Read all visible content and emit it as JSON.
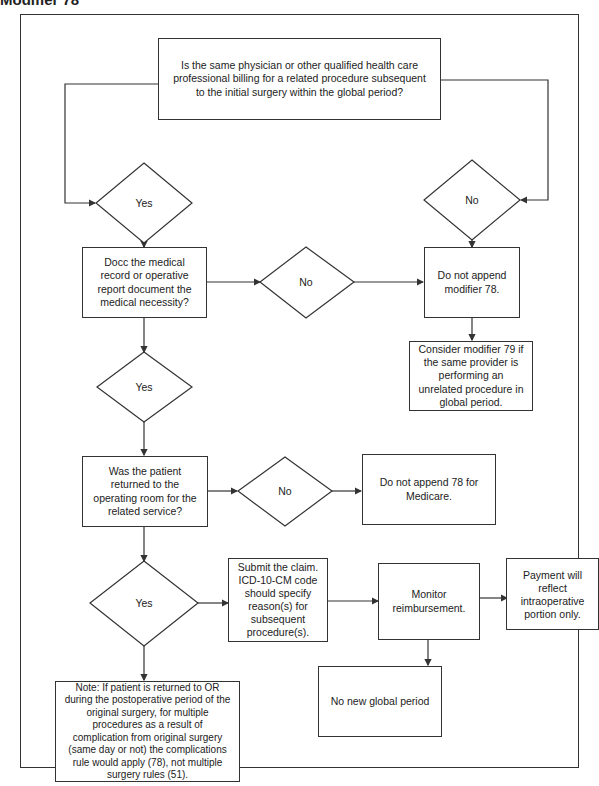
{
  "heading": "Modifier 78",
  "nodes": {
    "q_same_physician": "Is the same physician or other qualified health care professional billing for a related procedure subsequent to the initial surgery within the global period?",
    "d1_yes": "Yes",
    "d1_no": "No",
    "q_medical_necessity": "Docc the medical record or operative report document the medical necessity?",
    "d2_no": "No",
    "r_no_modifier_78": "Do not append modifier 78.",
    "r_consider_79": "Consider modifier 79 if the same provider is performing an unrelated procedure in global period.",
    "d2_yes": "Yes",
    "q_returned_or": "Was the patient returned to the operating room for the related service?",
    "d3_no": "No",
    "r_no_78_medicare": "Do not append 78 for Medicare.",
    "d3_yes": "Yes",
    "r_submit_claim": "Submit the claim. ICD-10-CM code should specify reason(s) for subsequent procedure(s).",
    "r_monitor": "Monitor reimbursement.",
    "r_payment": "Payment will reflect intraoperative portion only.",
    "r_no_global": "No new global period",
    "note": "Note:  If patient is returned to OR during the postoperative period of the original surgery, for multiple procedures as a result of complication from original surgery (same day or not) the complications rule would apply (78), not multiple surgery rules (51)."
  },
  "colors": {
    "line": "#333333",
    "text": "#222222",
    "background": "#ffffff"
  }
}
